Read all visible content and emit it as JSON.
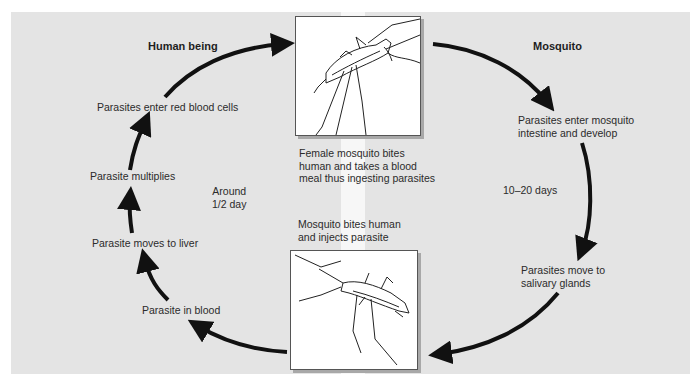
{
  "diagram": {
    "sections": {
      "human": "Human being",
      "mosquito": "Mosquito"
    },
    "human_steps": [
      "Parasites enter red blood cells",
      "Parasite multiplies",
      "Parasite moves to liver",
      "Parasite in blood"
    ],
    "human_duration": [
      "Around",
      "1/2 day"
    ],
    "mosquito_steps": [
      [
        "Parasites enter mosquito",
        "intestine and develop"
      ],
      [
        "Parasites move to",
        "salivary glands"
      ]
    ],
    "mosquito_duration": "10–20 days",
    "top_image_caption": [
      "Female mosquito bites",
      "human and takes a blood",
      "meal thus ingesting parasites"
    ],
    "bottom_image_caption": [
      "Mosquito bites human",
      "and injects parasite"
    ],
    "images": {
      "top": "mosquito-biting-illustration",
      "bottom": "mosquito-injecting-illustration"
    },
    "colors": {
      "panel": "#e4e4e4",
      "arrow": "#111111",
      "text": "#2b2b2b",
      "stripe": "#f7f7f7"
    }
  }
}
